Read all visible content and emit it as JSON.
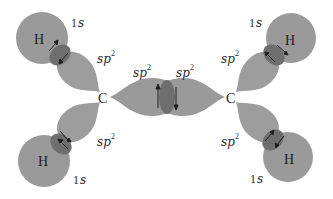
{
  "diagram": {
    "type": "orbital-overlap",
    "colors": {
      "orbital_fill": "#9a9a9a",
      "overlap_fill": "#6e6e6e",
      "text": "#2a2a2a",
      "arrow": "#1e1e1e"
    },
    "carbons": [
      {
        "label": "C"
      },
      {
        "label": "C"
      }
    ],
    "hydrogens": [
      {
        "label": "H"
      },
      {
        "label": "H"
      },
      {
        "label": "H"
      },
      {
        "label": "H"
      }
    ],
    "orbital_labels": {
      "s_num": "1",
      "s_letter": "s",
      "sp_base": "sp",
      "sp_exp": "2"
    }
  }
}
